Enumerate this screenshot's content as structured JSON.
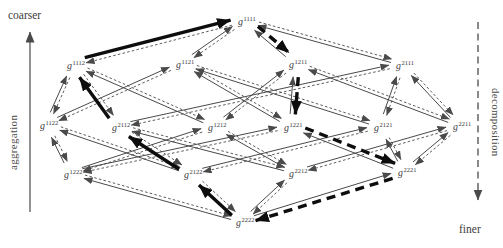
{
  "figure": {
    "labels": {
      "coarser": "coarser",
      "finer": "finer",
      "left_axis": "aggregation",
      "right_axis": "decomposition"
    },
    "colors": {
      "background": "#ffffff",
      "line": "#4a4a4a",
      "text": "#3c3c3c",
      "emphasis": "#0d0d0d"
    },
    "node_base": "g",
    "nodes": [
      {
        "sup": "1111",
        "x": 245,
        "y": 20
      },
      {
        "sup": "1112",
        "x": 74,
        "y": 64
      },
      {
        "sup": "1121",
        "x": 183,
        "y": 63
      },
      {
        "sup": "1211",
        "x": 296,
        "y": 63
      },
      {
        "sup": "2111",
        "x": 403,
        "y": 64
      },
      {
        "sup": "1122",
        "x": 47,
        "y": 124
      },
      {
        "sup": "2112",
        "x": 119,
        "y": 126
      },
      {
        "sup": "1212",
        "x": 215,
        "y": 126
      },
      {
        "sup": "1221",
        "x": 291,
        "y": 126
      },
      {
        "sup": "2121",
        "x": 381,
        "y": 126
      },
      {
        "sup": "2211",
        "x": 460,
        "y": 125
      },
      {
        "sup": "1222",
        "x": 71,
        "y": 173
      },
      {
        "sup": "2122",
        "x": 191,
        "y": 173
      },
      {
        "sup": "2212",
        "x": 296,
        "y": 172
      },
      {
        "sup": "2221",
        "x": 405,
        "y": 171
      },
      {
        "sup": "2222",
        "x": 243,
        "y": 221
      }
    ],
    "edges": [
      [
        "1111",
        "1112"
      ],
      [
        "1111",
        "1121"
      ],
      [
        "1111",
        "1211"
      ],
      [
        "1111",
        "2111"
      ],
      [
        "1112",
        "1122"
      ],
      [
        "1112",
        "1212"
      ],
      [
        "1112",
        "2112"
      ],
      [
        "1121",
        "1122"
      ],
      [
        "1121",
        "1221"
      ],
      [
        "1121",
        "2121"
      ],
      [
        "1211",
        "1212"
      ],
      [
        "1211",
        "1221"
      ],
      [
        "1211",
        "2211"
      ],
      [
        "2111",
        "2112"
      ],
      [
        "2111",
        "2121"
      ],
      [
        "2111",
        "2211"
      ],
      [
        "1122",
        "1222"
      ],
      [
        "1122",
        "2122"
      ],
      [
        "2112",
        "2122"
      ],
      [
        "2112",
        "2212"
      ],
      [
        "1212",
        "1222"
      ],
      [
        "1212",
        "2212"
      ],
      [
        "1221",
        "1222"
      ],
      [
        "1221",
        "2221"
      ],
      [
        "2121",
        "2122"
      ],
      [
        "2121",
        "2221"
      ],
      [
        "2211",
        "2212"
      ],
      [
        "2211",
        "2221"
      ],
      [
        "1222",
        "2222"
      ],
      [
        "2122",
        "2222"
      ],
      [
        "2212",
        "2222"
      ],
      [
        "2221",
        "2222"
      ]
    ],
    "aggregation_path": [
      "2222",
      "2122",
      "2112",
      "1112",
      "1111"
    ],
    "decomposition_path": [
      "1111",
      "1211",
      "1221",
      "2221",
      "2222"
    ],
    "left_axis_arrow": {
      "style": "solid",
      "direction": "up"
    },
    "right_axis_arrow": {
      "style": "dashed",
      "direction": "down"
    }
  }
}
